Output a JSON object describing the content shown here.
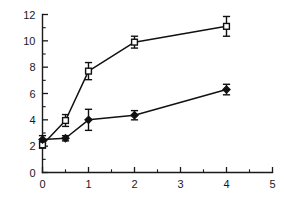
{
  "chart_data": {
    "type": "line",
    "title": "",
    "subtitle": "",
    "xlabel": "",
    "ylabel": "",
    "xlim": [
      0,
      5
    ],
    "ylim": [
      0,
      12
    ],
    "grid": false,
    "legend": "none",
    "x_ticks_major": [
      0,
      1,
      2,
      3,
      4,
      5
    ],
    "x_ticks_minor": [
      0.5,
      1.5,
      2.5,
      3.5,
      4.5
    ],
    "x_tick_labels": [
      "0",
      "1",
      "2",
      "3",
      "4",
      "5"
    ],
    "y_ticks_major": [
      0,
      2,
      4,
      6,
      8,
      10,
      12
    ],
    "y_ticks_minor": [
      1,
      3,
      5,
      7,
      9,
      11
    ],
    "y_tick_labels": [
      "0",
      "2",
      "4",
      "6",
      "8",
      "10",
      "12"
    ],
    "x": [
      0,
      0.5,
      1,
      2,
      4
    ],
    "series": [
      {
        "name": "open-square-series",
        "marker": "open-square",
        "values": [
          2.1,
          3.95,
          7.7,
          9.9,
          11.1
        ],
        "errors": [
          0.25,
          0.45,
          0.65,
          0.45,
          0.75
        ]
      },
      {
        "name": "filled-diamond-series",
        "marker": "filled-diamond",
        "values": [
          2.5,
          2.6,
          4.0,
          4.35,
          6.3
        ],
        "errors": [
          0.3,
          0.2,
          0.8,
          0.35,
          0.4
        ]
      }
    ]
  },
  "colors": {
    "axis": "#1a1a1a",
    "line": "#111111",
    "marker_fill_open": "#ffffff",
    "marker_fill_solid": "#111111",
    "background": "#ffffff"
  }
}
